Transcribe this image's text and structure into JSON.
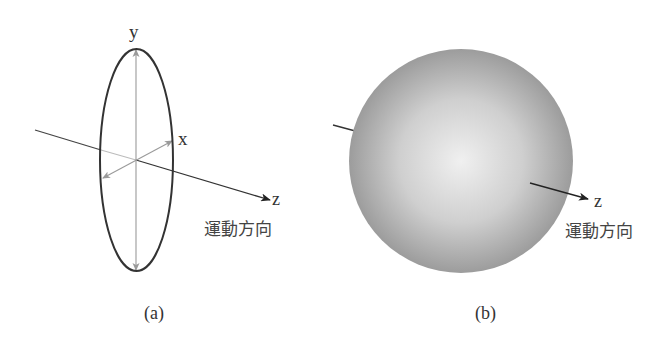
{
  "panel_a": {
    "caption": "(a)",
    "axis_labels": {
      "x": "x",
      "y": "y",
      "z": "z"
    },
    "direction_label": "運動方向",
    "shape": "ellipse (flattened disk)"
  },
  "panel_b": {
    "caption": "(b)",
    "axis_labels": {
      "z": "z"
    },
    "direction_label": "運動方向",
    "shape": "sphere"
  },
  "colors": {
    "outline": "#333333",
    "axis_gray": "#999999",
    "sphere_center": "#efefef",
    "sphere_edge": "#9d9d9d"
  }
}
